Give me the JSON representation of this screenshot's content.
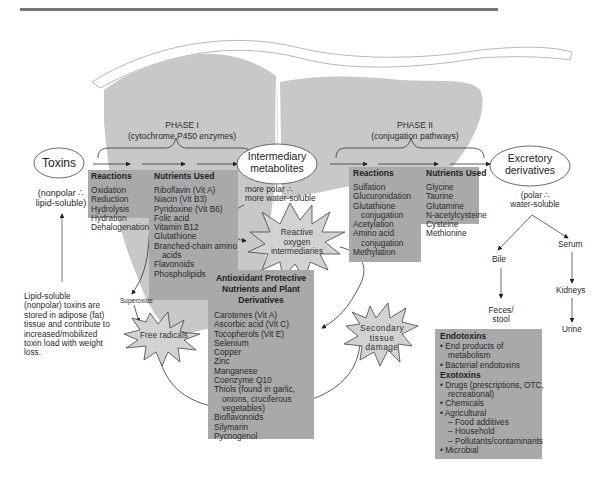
{
  "diagram": {
    "title_rule": true,
    "phase1": {
      "title": "PHASE I",
      "subtitle": "(cytochrome P450 enzymes)"
    },
    "phase2": {
      "title": "PHASE II",
      "subtitle": "(conjugation pathways)"
    },
    "nodes": {
      "toxins": {
        "label": "Toxins",
        "note_line1": "(nonpolar ∴",
        "note_line2": "lipid-soluble)"
      },
      "intermediary": {
        "line1": "Intermediary",
        "line2": "metabolites",
        "note_line1": "more polar ∴",
        "note_line2": "more water-soluble"
      },
      "excretory": {
        "line1": "Excretory",
        "line2": "derivatives",
        "note_line1": "(polar ∴",
        "note_line2": "water-soluble"
      }
    },
    "phase1_reactions": {
      "header": "Reactions",
      "items": [
        "Oxidation",
        "Reduction",
        "Hydrolysis",
        "Hydration",
        "Dehalogenation"
      ]
    },
    "phase1_nutrients": {
      "header": "Nutrients Used",
      "items": [
        "Riboflavin (Vit A)",
        "Niacin (Vit B3)",
        "Pyridoxine (Vit B6)",
        "Folic acid",
        "Vitamin B12",
        "Glutathione",
        "Branched-chain amino",
        "acids",
        "Flavonoids",
        "Phospholipids"
      ]
    },
    "phase2_reactions": {
      "header": "Reactions",
      "items": [
        "Sulfation",
        "Glucuronidation",
        "Glutathione",
        "conjugation",
        "Acetylation",
        "Amino acid",
        "conjugation",
        "Methylation"
      ]
    },
    "phase2_nutrients": {
      "header": "Nutrients Used",
      "items": [
        "Glycine",
        "Taurine",
        "Glutamine",
        "N-acetylcysteine",
        "Cysteine",
        "Methionine"
      ]
    },
    "antioxidants": {
      "header_line1": "Antioxidant Protective",
      "header_line2": "Nutrients and Plant",
      "header_line3": "Derivatives",
      "items": [
        "Carotenes (Vit A)",
        "Ascorbic acid (Vit C)",
        "Tocopherols (Vit E)",
        "Selenium",
        "Copper",
        "Zinc",
        "Manganese",
        "Coenzyme Q10",
        "Thiols (found in garlic,",
        "onions, cruciferous",
        "vegetables)",
        "Bioflavonoids",
        "Silymarin",
        "Pycnogenol"
      ]
    },
    "bursts": {
      "reactive": {
        "line1": "Reactive",
        "line2": "oxygen",
        "line3": "intermediaries"
      },
      "free_radicals": {
        "label": "Free radicals"
      },
      "secondary": {
        "line1": "Secondary",
        "line2": "tissue",
        "line3": "damage"
      }
    },
    "superoxide_label": "Superoxide",
    "lipid_note": [
      "Lipid-soluble",
      "(nonpolar) toxins are",
      "stored in adipose (fat)",
      "tissue and contribute to",
      "increased/mobilized",
      "toxin load with weight",
      "loss."
    ],
    "excretion": {
      "bile": "Bile",
      "feces_line1": "Feces/",
      "feces_line2": "stool",
      "serum": "Serum",
      "kidneys": "Kidneys",
      "urine": "Urine"
    },
    "toxin_sources": {
      "endotoxins_header": "Endotoxins",
      "endo_items": [
        "• End products of",
        "  metabolism",
        "• Bacterial endotoxins"
      ],
      "exotoxins_header": "Exotoxins",
      "exo_items": [
        "• Drugs (prescriptions, OTC,",
        "  recreational)",
        "• Chemicals",
        "• Agricultural",
        "  – Food additives",
        "  – Household",
        "  – Pollutants/contaminants",
        "• Microbial"
      ]
    },
    "colors": {
      "liver_fill": "#c8c8c8",
      "box_fill": "#a9a9a9",
      "burst_fill": "#d2d2d2",
      "line": "#333333",
      "rule": "#777777"
    }
  }
}
